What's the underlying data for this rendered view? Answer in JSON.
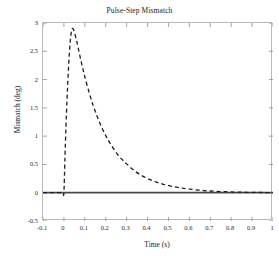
{
  "chart_data": {
    "type": "line",
    "title": "Pulse-Step Mismatch",
    "xlabel": "Time (s)",
    "ylabel": "Mismatch (deg)",
    "xlim": [
      -0.1,
      1
    ],
    "ylim": [
      -0.5,
      3
    ],
    "grid": false,
    "legend": "none",
    "linestyle": "dashed",
    "line_color": "#1f1f1f",
    "xticks": [
      -0.1,
      0,
      0.1,
      0.2,
      0.3,
      0.4,
      0.5,
      0.6,
      0.7,
      0.8,
      0.9,
      1
    ],
    "xticklabels": [
      "-0.1",
      "0",
      "0.1",
      "0.2",
      "0.3",
      "0.4",
      "0.5",
      "0.6",
      "0.7",
      "0.8",
      "0.9",
      "1"
    ],
    "yticks": [
      -0.5,
      0,
      0.5,
      1,
      1.5,
      2,
      2.5,
      3
    ],
    "yticklabels": [
      "-0.5",
      "0",
      "0.5",
      "1",
      "1.5",
      "2",
      "2.5",
      "3"
    ],
    "series": [
      {
        "name": "Mismatch",
        "style": "dashed",
        "color": "#1f1f1f",
        "x": [
          -0.1,
          -0.05,
          -0.02,
          -0.005,
          0,
          0.005,
          0.01,
          0.015,
          0.02,
          0.025,
          0.03,
          0.035,
          0.04,
          0.045,
          0.05,
          0.06,
          0.07,
          0.08,
          0.09,
          0.1,
          0.12,
          0.14,
          0.16,
          0.18,
          0.2,
          0.22,
          0.25,
          0.28,
          0.3,
          0.33,
          0.36,
          0.4,
          0.44,
          0.48,
          0.52,
          0.56,
          0.6,
          0.65,
          0.7,
          0.75,
          0.8,
          0.85,
          0.9,
          0.95,
          1
        ],
        "y": [
          0,
          0,
          0,
          0,
          0,
          0.62,
          1.18,
          1.66,
          2.06,
          2.4,
          2.66,
          2.83,
          2.9,
          2.89,
          2.84,
          2.7,
          2.53,
          2.36,
          2.2,
          2.05,
          1.78,
          1.54,
          1.34,
          1.16,
          1.01,
          0.88,
          0.71,
          0.58,
          0.51,
          0.41,
          0.33,
          0.25,
          0.19,
          0.145,
          0.11,
          0.085,
          0.065,
          0.044,
          0.03,
          0.021,
          0.014,
          0.009,
          0.006,
          0.004,
          0.002
        ]
      },
      {
        "name": "Zero reference",
        "style": "solid",
        "color": "#4a4a4a",
        "x": [
          -0.1,
          1
        ],
        "y": [
          0,
          0
        ]
      }
    ],
    "annotations": {
      "peak_time": 0.04,
      "peak_value": 2.9
    }
  }
}
